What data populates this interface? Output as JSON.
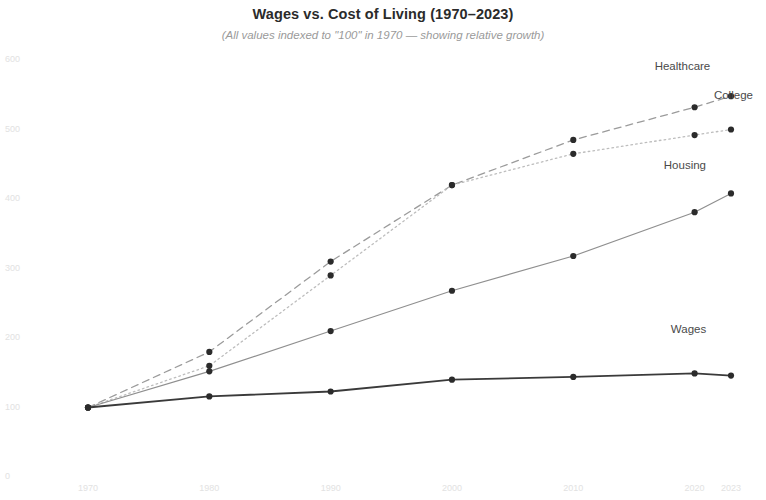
{
  "chart_data": {
    "type": "line",
    "title": "Wages vs. Cost of Living (1970–2023)",
    "subtitle": "(All values indexed to \"100\" in 1970 — showing relative growth)",
    "xlabel": "",
    "ylabel": "",
    "x": [
      1970,
      1980,
      1990,
      2000,
      2010,
      2020,
      2023
    ],
    "xticklabels": [
      "1970",
      "1980",
      "1990",
      "2000",
      "2010",
      "2020",
      "2023"
    ],
    "yticks": [
      0,
      100,
      200,
      300,
      400,
      500,
      600
    ],
    "yticklabels": [
      "0",
      "100",
      "200",
      "300",
      "400",
      "500",
      "600"
    ],
    "ylim": [
      0,
      600
    ],
    "xlim": [
      1970,
      2023
    ],
    "grid": false,
    "legend": "inline-end-labels",
    "series": [
      {
        "name": "Healthcare",
        "values": [
          100,
          180,
          310,
          420,
          485,
          532,
          548
        ],
        "linestyle": "dashed",
        "color": "#9b9b9b",
        "marker": "circle",
        "marker_color": "#2b2b2b",
        "label_x": 2019.0,
        "label_y": 590
      },
      {
        "name": "College",
        "values": [
          100,
          160,
          290,
          420,
          465,
          492,
          500
        ],
        "linestyle": "dotted",
        "color": "#bdbdbd",
        "marker": "circle",
        "marker_color": "#2b2b2b",
        "label_x": 2023.2,
        "label_y": 548
      },
      {
        "name": "Housing",
        "values": [
          100,
          152,
          210,
          268,
          318,
          381,
          408
        ],
        "linestyle": "solid",
        "color": "#8f8f8f",
        "marker": "circle",
        "marker_color": "#2b2b2b",
        "label_x": 2019.2,
        "label_y": 447
      },
      {
        "name": "Wages",
        "values": [
          100,
          116,
          123,
          140,
          144,
          149,
          146
        ],
        "linestyle": "solid",
        "color": "#3a3a3a",
        "marker": "circle",
        "marker_color": "#2b2b2b",
        "label_x": 2019.5,
        "label_y": 212
      }
    ]
  }
}
